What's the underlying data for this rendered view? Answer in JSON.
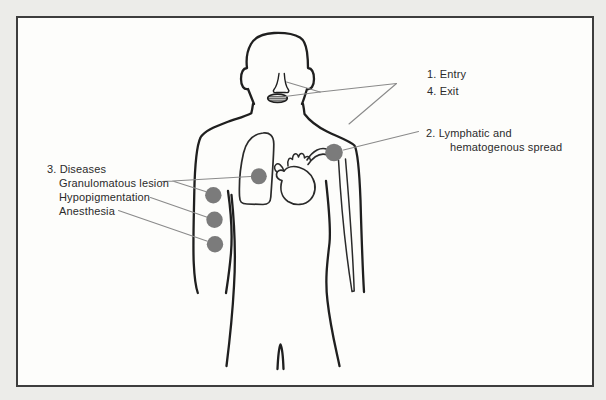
{
  "figure": {
    "kind": "annotated human torso line drawing",
    "view": "front-facing, head to hips, arms at sides"
  },
  "labels": {
    "entry": "1. Entry",
    "exit": "4. Exit",
    "lymphatic_line1": "2. Lymphatic and",
    "lymphatic_line2": "hematogenous spread",
    "diseases_title": "3. Diseases",
    "disease_items": [
      "Granulomatous lesion",
      "Hypopigmentation",
      "Anesthesia"
    ]
  },
  "markers": {
    "count": 5,
    "shape": "filled gray circle"
  },
  "colors": {
    "marker": "#7b7b7b",
    "outline": "#1f1f1f",
    "leader": "#8a8a8a",
    "frame": "#3d3d3d",
    "text": "#2b2b2b",
    "canvas": "#fdfdfb",
    "page": "#ecece9"
  }
}
